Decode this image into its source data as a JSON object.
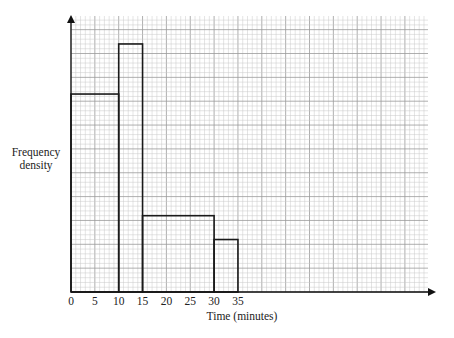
{
  "chart_data": {
    "type": "bar",
    "subtype": "histogram",
    "title": "",
    "xlabel": "Time (minutes)",
    "ylabel": "Frequency density",
    "x_ticks": [
      0,
      5,
      10,
      15,
      20,
      25,
      30,
      35
    ],
    "xlim": [
      0,
      37
    ],
    "y_ticks_labeled": false,
    "grid": true,
    "legend": null,
    "bins": [
      {
        "from": 0,
        "to": 10,
        "height_grid_squares": 41.5
      },
      {
        "from": 10,
        "to": 15,
        "height_grid_squares": 52
      },
      {
        "from": 15,
        "to": 30,
        "height_grid_squares": 16
      },
      {
        "from": 30,
        "to": 35,
        "height_grid_squares": 11
      }
    ],
    "categories": [
      "0-10",
      "10-15",
      "15-30",
      "30-35"
    ],
    "values": [
      41.5,
      52,
      16,
      11
    ],
    "colors": {
      "grid_minor": "#c8c8c8",
      "grid_major": "#9a9a9a",
      "bar_outline": "#1a1a1a",
      "axis": "#111111"
    }
  },
  "labels": {
    "y_axis": [
      "Frequency",
      "density"
    ],
    "x_axis": "Time (minutes)"
  }
}
